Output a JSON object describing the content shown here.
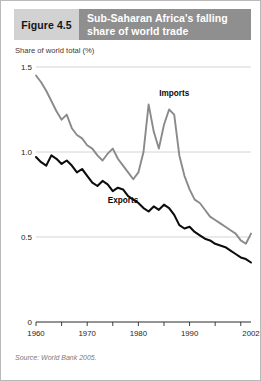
{
  "figure": {
    "number_label": "Figure 4.5",
    "title": "Sub-Saharan Africa's falling share of world trade",
    "source": "Source: World Bank 2005.",
    "accent_dark": "#8f8f8f",
    "accent_light": "#d2d2d2"
  },
  "chart_data": {
    "type": "line",
    "title": "Sub-Saharan Africa's falling share of world trade",
    "subtitle": "",
    "xlabel": "",
    "ylabel": "Share of world total (%)",
    "axis_caption": "Share of world total (%)",
    "grid": true,
    "legend_position": "inline-annotation",
    "xlim": [
      1960,
      2002
    ],
    "ylim": [
      0,
      1.5
    ],
    "yticks": [
      0,
      0.5,
      1.0,
      1.5
    ],
    "ytick_labels": [
      "0",
      "0.5",
      "1.0",
      "1.5"
    ],
    "xticks": [
      1960,
      1965,
      1970,
      1975,
      1980,
      1985,
      1990,
      1995,
      2000
    ],
    "xtick_labels_shown": [
      "1960",
      "1970",
      "1980",
      "1990",
      "2002"
    ],
    "xtick_label_values": [
      1960,
      1970,
      1980,
      1990,
      2002
    ],
    "x": [
      1960,
      1961,
      1962,
      1963,
      1964,
      1965,
      1966,
      1967,
      1968,
      1969,
      1970,
      1971,
      1972,
      1973,
      1974,
      1975,
      1976,
      1977,
      1978,
      1979,
      1980,
      1981,
      1982,
      1983,
      1984,
      1985,
      1986,
      1987,
      1988,
      1989,
      1990,
      1991,
      1992,
      1993,
      1994,
      1995,
      1996,
      1997,
      1998,
      1999,
      2000,
      2001,
      2002
    ],
    "series": [
      {
        "name": "Imports",
        "color": "#8a8a8a",
        "label_x": 1987,
        "label_y": 1.33,
        "values": [
          1.45,
          1.41,
          1.36,
          1.3,
          1.24,
          1.19,
          1.22,
          1.14,
          1.1,
          1.08,
          1.04,
          1.02,
          0.98,
          0.95,
          0.99,
          1.02,
          0.96,
          0.92,
          0.88,
          0.84,
          0.88,
          1.0,
          1.28,
          1.12,
          1.02,
          1.16,
          1.25,
          1.22,
          0.98,
          0.86,
          0.78,
          0.72,
          0.7,
          0.66,
          0.62,
          0.6,
          0.58,
          0.56,
          0.54,
          0.52,
          0.48,
          0.46,
          0.52
        ]
      },
      {
        "name": "Exports",
        "color": "#0d0d0d",
        "label_x": 1977,
        "label_y": 0.7,
        "values": [
          0.97,
          0.94,
          0.92,
          0.98,
          0.96,
          0.93,
          0.95,
          0.92,
          0.88,
          0.9,
          0.86,
          0.82,
          0.8,
          0.83,
          0.81,
          0.77,
          0.79,
          0.78,
          0.74,
          0.72,
          0.7,
          0.67,
          0.65,
          0.68,
          0.66,
          0.69,
          0.67,
          0.63,
          0.57,
          0.55,
          0.56,
          0.53,
          0.51,
          0.49,
          0.48,
          0.46,
          0.45,
          0.44,
          0.42,
          0.4,
          0.38,
          0.37,
          0.35
        ]
      }
    ]
  }
}
